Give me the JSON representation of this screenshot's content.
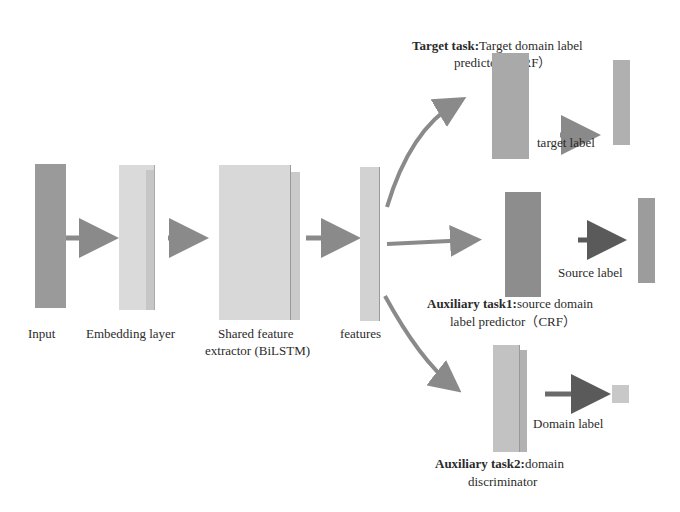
{
  "diagram": {
    "nodes": {
      "input": {
        "label": "Input",
        "color": "#9a9a9a"
      },
      "embedding": {
        "label": "Embedding layer",
        "color": "#d8d8d8"
      },
      "shared": {
        "label_line1": "Shared feature",
        "label_line2": "extractor (BiLSTM)",
        "color": "#d6d6d6"
      },
      "features": {
        "label": "features",
        "color": "#cfcfcf"
      },
      "target_predictor": {
        "title_bold": "Target task:",
        "title_rest": "Target domain label",
        "title_line2": "predictor（CRF）",
        "color": "#a8a8a8"
      },
      "target_label": {
        "label": "target label",
        "color": "#b0b0b0"
      },
      "source_predictor": {
        "title_bold": "Auxiliary task1:",
        "title_rest": "source domain",
        "title_line2": "label predictor（CRF）",
        "color": "#8c8c8c"
      },
      "source_label": {
        "label": "Source label",
        "color": "#9c9c9c"
      },
      "domain_discriminator": {
        "title_bold": "Auxiliary task2:",
        "title_rest": "domain",
        "title_line2": "discriminator",
        "color": "#c4c4c4"
      },
      "domain_label": {
        "label": "Domain label",
        "color": "#c8c8c8"
      }
    },
    "edges": [
      {
        "from": "input",
        "to": "embedding"
      },
      {
        "from": "embedding",
        "to": "shared"
      },
      {
        "from": "shared",
        "to": "features"
      },
      {
        "from": "features",
        "to": "target_predictor"
      },
      {
        "from": "features",
        "to": "source_predictor"
      },
      {
        "from": "features",
        "to": "domain_discriminator"
      },
      {
        "from": "target_predictor",
        "to": "target_label"
      },
      {
        "from": "source_predictor",
        "to": "source_label"
      },
      {
        "from": "domain_discriminator",
        "to": "domain_label"
      }
    ],
    "arrow_color": "#8a8a8a",
    "dark_arrow_color": "#5a5a5a"
  }
}
